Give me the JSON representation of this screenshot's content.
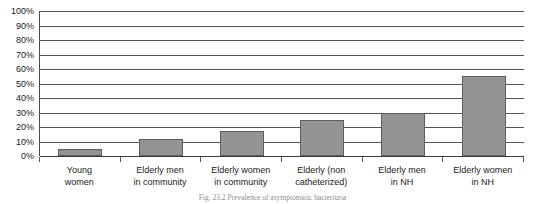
{
  "chart_data": {
    "type": "bar",
    "title": "",
    "subtitle": "",
    "xlabel": "",
    "ylabel": "",
    "ylim": [
      0,
      100
    ],
    "grid": true,
    "legend": false,
    "legend_position": "none",
    "bar_color": "#949494",
    "bar_border_color": "#5d5d5d",
    "gridline_color": "#555555",
    "axis_color": "#3a3a3a",
    "value_suffix": "%",
    "categories": [
      "Young women",
      "Elderly men in community",
      "Elderly women in community",
      "Elderly (non catheterized)",
      "Elderly men in NH",
      "Elderly women in NH"
    ],
    "category_lines": [
      [
        "Young",
        "women"
      ],
      [
        "Elderly men",
        "in community"
      ],
      [
        "Elderly women",
        "in community"
      ],
      [
        "Elderly (non",
        "catheterized)"
      ],
      [
        "Elderly men",
        "in NH"
      ],
      [
        "Elderly women",
        "in NH"
      ]
    ],
    "values": [
      5,
      12,
      17.5,
      24.5,
      30,
      55
    ],
    "y_ticks": [
      0,
      10,
      20,
      30,
      40,
      50,
      60,
      70,
      80,
      90,
      100
    ],
    "y_tick_labels": [
      "0%",
      "10%",
      "20%",
      "30%",
      "40%",
      "50%",
      "60%",
      "70%",
      "80%",
      "90%",
      "100%"
    ]
  },
  "caption": {
    "text": "Fig. 23.2  Prevalence of asymptomatic bacteriuria"
  }
}
